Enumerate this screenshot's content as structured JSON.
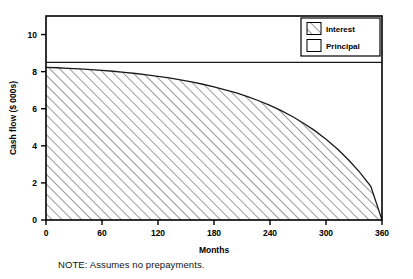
{
  "figure": {
    "note": "NOTE: Assumes no prepayments."
  },
  "chart_data": {
    "type": "area",
    "title": "",
    "xlabel": "Months",
    "ylabel": "Cash flow ($ 000s)",
    "xlim": [
      0,
      360
    ],
    "ylim": [
      0,
      11
    ],
    "xticks": [
      0,
      60,
      120,
      180,
      240,
      300,
      360
    ],
    "xtick_labels": [
      "0",
      "60",
      "120",
      "180",
      "240",
      "300",
      "360"
    ],
    "yticks": [
      0,
      2,
      4,
      6,
      8,
      10
    ],
    "ytick_labels": [
      "0",
      "2",
      "4",
      "6",
      "8",
      "10"
    ],
    "grid": false,
    "legend_position": "top-right",
    "legend": [
      {
        "name": "Interest",
        "fill": "hatch",
        "label": "Interest"
      },
      {
        "name": "Principal",
        "fill": "white",
        "label": "Principal"
      }
    ],
    "series": [
      {
        "name": "Total payment",
        "type": "line",
        "constant_value": 8.5,
        "x": [
          0,
          360
        ],
        "values": [
          8.5,
          8.5
        ]
      },
      {
        "name": "Interest",
        "type": "area",
        "x": [
          0,
          12,
          24,
          36,
          48,
          60,
          72,
          84,
          96,
          108,
          120,
          132,
          144,
          156,
          168,
          180,
          192,
          204,
          216,
          228,
          240,
          252,
          264,
          276,
          288,
          300,
          312,
          324,
          336,
          348,
          360
        ],
        "values": [
          8.23,
          8.21,
          8.18,
          8.15,
          8.11,
          8.07,
          8.02,
          7.96,
          7.9,
          7.83,
          7.75,
          7.66,
          7.56,
          7.45,
          7.32,
          7.18,
          7.02,
          6.85,
          6.65,
          6.43,
          6.18,
          5.9,
          5.58,
          5.22,
          4.82,
          4.36,
          3.84,
          3.25,
          2.58,
          1.82,
          0.0
        ]
      }
    ],
    "colors": {
      "axis": "#000000",
      "line": "#1a1a1a",
      "hatch": "#555555",
      "background": "#ffffff"
    }
  }
}
